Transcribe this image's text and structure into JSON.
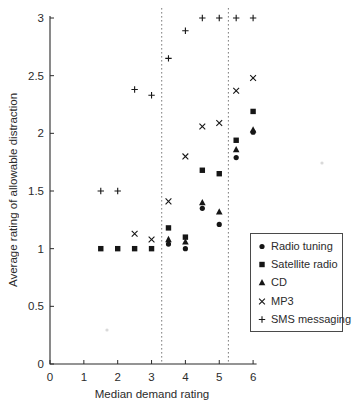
{
  "chart_data": {
    "type": "scatter",
    "title": "",
    "xlabel": "Median demand rating",
    "ylabel": "Average rating of allowable distraction",
    "xlim": [
      0,
      6
    ],
    "ylim": [
      0,
      3
    ],
    "x_ticks": [
      0,
      1,
      2,
      3,
      4,
      5,
      6
    ],
    "x_tick_labels": [
      "0",
      "1",
      "2",
      "3",
      "4",
      "5",
      "6"
    ],
    "y_ticks": [
      0,
      0.5,
      1,
      1.5,
      2,
      2.5,
      3
    ],
    "y_tick_labels": [
      "0",
      "0.5",
      "1",
      "1.5",
      "2",
      "2.5",
      "3"
    ],
    "grid": false,
    "legend_position": "right-middle",
    "reference_lines": [
      {
        "axis": "x",
        "value": 3.3,
        "style": "dashed"
      },
      {
        "axis": "x",
        "value": 5.27,
        "style": "dashed"
      }
    ],
    "series": [
      {
        "name": "Radio tuning",
        "marker": "circle",
        "points": [
          [
            3.5,
            1.04
          ],
          [
            4,
            1.0
          ],
          [
            4.5,
            1.35
          ],
          [
            5,
            1.21
          ],
          [
            5.5,
            1.79
          ],
          [
            6,
            2.01
          ]
        ]
      },
      {
        "name": "Satellite radio",
        "marker": "square",
        "points": [
          [
            1.5,
            1.0
          ],
          [
            2,
            1.0
          ],
          [
            2.5,
            1.0
          ],
          [
            3,
            1.0
          ],
          [
            3.5,
            1.18
          ],
          [
            4,
            1.1
          ],
          [
            4.5,
            1.68
          ],
          [
            5,
            1.65
          ],
          [
            5.5,
            1.94
          ],
          [
            6,
            2.19
          ]
        ]
      },
      {
        "name": "CD",
        "marker": "triangle",
        "points": [
          [
            3.5,
            1.08
          ],
          [
            4,
            1.06
          ],
          [
            4.5,
            1.4
          ],
          [
            5,
            1.32
          ],
          [
            5.5,
            1.86
          ],
          [
            6,
            2.03
          ]
        ]
      },
      {
        "name": "MP3",
        "marker": "x-cross",
        "points": [
          [
            2.5,
            1.13
          ],
          [
            3,
            1.08
          ],
          [
            3.5,
            1.41
          ],
          [
            4,
            1.8
          ],
          [
            4.5,
            2.06
          ],
          [
            5,
            2.09
          ],
          [
            5.5,
            2.37
          ],
          [
            6,
            2.48
          ]
        ]
      },
      {
        "name": "SMS messaging",
        "marker": "plus",
        "points": [
          [
            1.5,
            1.5
          ],
          [
            2,
            1.5
          ],
          [
            2.5,
            2.38
          ],
          [
            3,
            2.33
          ],
          [
            3.5,
            2.65
          ],
          [
            4,
            2.89
          ],
          [
            4.5,
            3
          ],
          [
            5,
            3
          ],
          [
            5.5,
            3
          ],
          [
            6,
            3
          ]
        ]
      }
    ]
  },
  "colors": {
    "ink": "#161616",
    "axis": "#2b2b2b",
    "dashed_line": "#7d7d7d",
    "speck": "#b9b9b9"
  },
  "scan_specks": [
    {
      "x_px": 107,
      "y_px": 330
    },
    {
      "x_px": 322,
      "y_px": 163
    }
  ]
}
